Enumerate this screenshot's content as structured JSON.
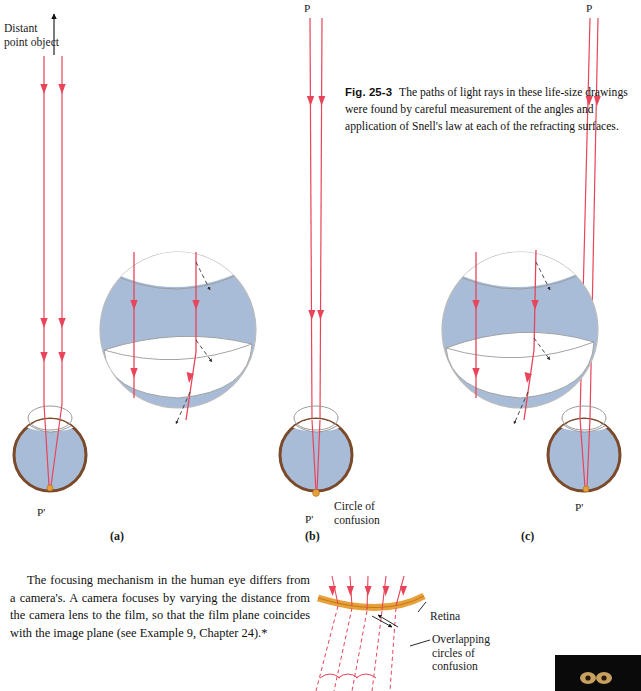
{
  "figure": {
    "label": "Fig. 25-3",
    "caption": "The paths of light rays in these life-size drawings were found by careful measurement of the angles and application of Snell's law at each of the refracting surfaces."
  },
  "labels": {
    "distant_point_object": "Distant point object",
    "p_top_b": "P",
    "p_top_c": "P",
    "p_prime_a": "P'",
    "p_prime_b": "P'",
    "p_prime_c": "P'",
    "circle_of_confusion": "Circle of confusion",
    "retina": "Retina",
    "overlapping_circles": "Overlapping circles of confusion",
    "panel_a": "(a)",
    "panel_b": "(b)",
    "panel_c": "(c)"
  },
  "body": {
    "paragraph": "The focusing mechanism in the human eye differs from a camera's. A camera focuses by varying the distance from the camera lens to the film, so that the film plane coincides with the image plane (see Example 9, Chapter 24).*"
  },
  "colors": {
    "ray": "#e8445a",
    "eye_fill": "#a8bcd8",
    "eye_outline": "#7a4a2a",
    "retina_orange": "#e8a03a",
    "cornea_line": "#555555",
    "point_dot": "#e08a2a",
    "text": "#111111"
  }
}
